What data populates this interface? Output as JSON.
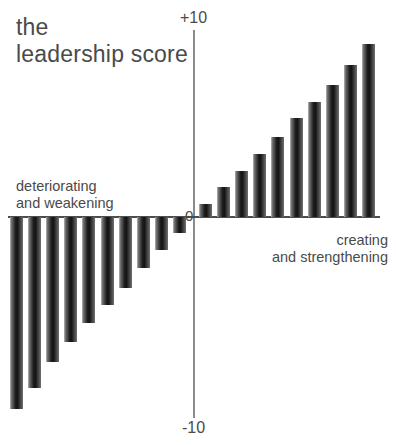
{
  "title": "the\nleadership score",
  "annotations": {
    "left": "deteriorating\nand weakening",
    "right": "creating\nand strengthening"
  },
  "axis": {
    "max_label": "+10",
    "zero_label": "0",
    "min_label": "-10"
  },
  "colors": {
    "background": "#ffffff",
    "text": "#4a4a4a",
    "bar_dark": "#141414",
    "bar_light": "#b9b9b9",
    "axis_x": "#4d4d4d",
    "axis_y": "#8a8a8a"
  },
  "chart_data": {
    "type": "bar",
    "title": "the leadership score",
    "xlabel": "",
    "ylabel": "",
    "ylim": [
      -10,
      10
    ],
    "grid": false,
    "legend": null,
    "annotations": [
      "deteriorating and weakening",
      "creating and strengthening"
    ],
    "categories": [
      "1",
      "2",
      "3",
      "4",
      "5",
      "6",
      "7",
      "8",
      "9",
      "10",
      "11",
      "12",
      "13",
      "14",
      "15",
      "16",
      "17",
      "18",
      "19",
      "20"
    ],
    "values": [
      -9.8,
      -8.7,
      -7.4,
      -6.4,
      -5.4,
      -4.5,
      -3.6,
      -2.6,
      -1.7,
      -0.8,
      0.7,
      1.6,
      2.5,
      3.4,
      4.3,
      5.3,
      6.2,
      7.1,
      8.2,
      9.3
    ]
  }
}
